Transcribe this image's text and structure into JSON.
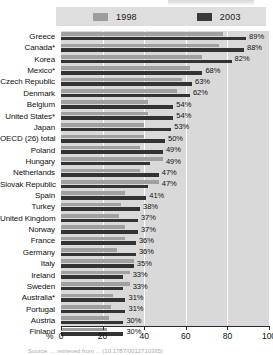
{
  "chart_data": {
    "type": "bar",
    "orientation": "horizontal",
    "title": "",
    "xlabel": "%",
    "ylabel": "",
    "xlim": [
      0,
      100
    ],
    "xticks": [
      0,
      20,
      40,
      60,
      80,
      100
    ],
    "grid": true,
    "legend_position": "top",
    "categories": [
      "Greece",
      "Canada*",
      "Korea",
      "Mexico*",
      "Czech Republic",
      "Denmark",
      "Belgium",
      "United States*",
      "Japan",
      "OECD (26) total",
      "Poland",
      "Hungary",
      "Netherlands",
      "Slovak Republic",
      "Spain",
      "Turkey",
      "United Kingdom",
      "Norway",
      "France",
      "Germany",
      "Italy",
      "Ireland",
      "Sweden",
      "Australia*",
      "Portugal",
      "Austria",
      "Finland"
    ],
    "series": [
      {
        "name": "1998",
        "color": "#a0a0a0",
        "values": [
          78,
          76,
          68,
          62,
          58,
          56,
          42,
          42,
          40,
          40,
          38,
          49,
          38,
          47,
          31,
          29,
          28,
          31,
          31,
          27,
          35,
          33,
          33,
          25,
          24,
          23,
          22
        ]
      },
      {
        "name": "2003",
        "color": "#333333",
        "values": [
          89,
          88,
          82,
          68,
          63,
          62,
          54,
          54,
          53,
          50,
          49,
          43,
          47,
          42,
          41,
          38,
          37,
          37,
          36,
          36,
          35,
          30,
          30,
          31,
          31,
          30,
          30
        ]
      }
    ],
    "data_labels": [
      "89%",
      "88%",
      "82%",
      "68%",
      "63%",
      "62%",
      "54%",
      "54%",
      "53%",
      "50%",
      "49%",
      "49%",
      "47%",
      "47%",
      "41%",
      "38%",
      "37%",
      "37%",
      "36%",
      "36%",
      "35%",
      "33%",
      "33%",
      "31%",
      "31%",
      "30%",
      "30%"
    ],
    "label_anchor_values": [
      89,
      88,
      82,
      68,
      63,
      62,
      54,
      54,
      53,
      50,
      49,
      49,
      47,
      47,
      41,
      38,
      37,
      37,
      36,
      36,
      35,
      33,
      33,
      31,
      31,
      30,
      30
    ]
  },
  "legend": {
    "series_1998": "1998",
    "series_2003": "2003"
  },
  "axis": {
    "unit_label": "%",
    "ticks": [
      "0",
      "20",
      "40",
      "60",
      "80",
      "100"
    ]
  },
  "footnote": {
    "clipped_text": "Source: ... retrieved from ... (10.1787/0012710365)"
  },
  "colors": {
    "series_1998": "#a0a0a0",
    "series_2003": "#333333",
    "plot_background": "#d9d9d9",
    "legend_background": "#dedede",
    "gridline": "#ffffff",
    "text": "#111111"
  }
}
